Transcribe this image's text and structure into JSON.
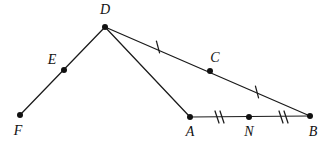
{
  "diagram": {
    "background_color": "#ffffff",
    "stroke_color": "#1a1a1a",
    "label_color": "#111111",
    "width": 324,
    "height": 146,
    "points": [
      {
        "id": "D",
        "label": "D",
        "x": 105,
        "y": 27,
        "label_x": 105,
        "label_y": 11,
        "label_anchor": "middle"
      },
      {
        "id": "E",
        "label": "E",
        "x": 64,
        "y": 70,
        "label_x": 52,
        "label_y": 61,
        "label_anchor": "middle"
      },
      {
        "id": "F",
        "label": "F",
        "x": 20,
        "y": 115,
        "label_x": 18,
        "label_y": 132,
        "label_anchor": "middle"
      },
      {
        "id": "C",
        "label": "C",
        "x": 210,
        "y": 71,
        "label_x": 215,
        "label_y": 59,
        "label_anchor": "middle"
      },
      {
        "id": "A",
        "label": "A",
        "x": 190,
        "y": 117,
        "label_x": 190,
        "label_y": 133,
        "label_anchor": "middle"
      },
      {
        "id": "N",
        "label": "N",
        "x": 249,
        "y": 117,
        "label_x": 249,
        "label_y": 133,
        "label_anchor": "middle"
      },
      {
        "id": "B",
        "label": "B",
        "x": 310,
        "y": 116,
        "label_x": 313,
        "label_y": 133,
        "label_anchor": "middle"
      }
    ],
    "segments": [
      {
        "id": "FD",
        "name": "segment-f-d",
        "from": "F",
        "to": "D"
      },
      {
        "id": "DB",
        "name": "segment-d-b",
        "from": "D",
        "to": "B"
      },
      {
        "id": "DA",
        "name": "segment-d-a",
        "from": "D",
        "to": "A"
      },
      {
        "id": "AB",
        "name": "segment-a-b",
        "from": "A",
        "to": "B"
      }
    ],
    "tick_marks": [
      {
        "id": "tick-dc",
        "name": "single-tick-on-dc",
        "count": 1,
        "x": 158,
        "y": 47,
        "angle": -15
      },
      {
        "id": "tick-cb",
        "name": "single-tick-on-cb",
        "count": 1,
        "x": 257,
        "y": 92,
        "angle": -15
      },
      {
        "id": "tick-an",
        "name": "double-tick-on-an",
        "count": 2,
        "x": 218,
        "y": 117,
        "angle": 0
      },
      {
        "id": "tick-nb",
        "name": "double-tick-on-nb",
        "count": 2,
        "x": 282,
        "y": 117,
        "angle": 0
      }
    ],
    "congruence_notes": [
      "DC is congruent to CB (single tick marks)",
      "AN is congruent to NB (double tick marks)"
    ]
  }
}
